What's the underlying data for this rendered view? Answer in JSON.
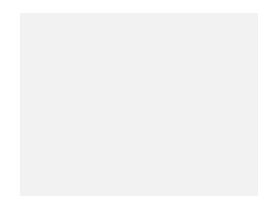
{
  "chart_data": {
    "type": "heatmap",
    "title": "",
    "columns": 29,
    "rows": 22,
    "colors": {
      "dark": "#4b4b4b",
      "light": "#ababab",
      "grid": "#f2f2f2"
    },
    "row_labels_left": [
      "22",
      "20",
      "18",
      "16",
      "14",
      "12",
      "10",
      "8",
      "6",
      "4",
      "2"
    ],
    "row_labels_right": [
      "21",
      "19",
      "17",
      "15",
      "13",
      "11",
      "9",
      "7",
      "5",
      "3",
      "1"
    ],
    "column_labels_bottom": [
      "28",
      "26",
      "24",
      "22",
      "20",
      "18",
      "16",
      "14",
      "12",
      "10",
      "8",
      "6",
      "4",
      "2"
    ],
    "legend": {
      "D": "dark",
      "L": "light"
    },
    "grid_top_to_bottom": [
      "LDDLLDDLLDDLLDDLLDDLLDDLLDDLL",
      "DDLDDLLDDLDDLLDDLDDLLDDLDDLDD",
      "DLDDLLDDLLDDLDDLDDLLDDLLDDLDD",
      "LDDLDDLDDLLDDLLLLDDLLDDLDDLDD",
      "DDDLDDDLDDDLDLDLDLDDDLDDDLDDD",
      "DLDDLDDDLDDLDDLDDLDDLDDDLDDLD",
      "LDDLDDLLDDDLDDDDDLDDDLLDDLDDL",
      "DDLDDLDDLLDDLDLDDLDLLDDLDDLDD",
      "LDDLDDLDDLDDDLDLDDDLDDLDDLDDL",
      "DLDDLDDLDDLDDDLDDDLDDLDDLDDLD",
      "DDLDDLDDLDDLDLLLDLDDLDDLDDLDD",
      "DDLDDLDDLDDLDLLLDLDDLDDLDDLDD",
      "DLDDLDDLDDLDDDLDDDLDDLDDLDDLD",
      "LDDLDDLDDLDDDLDLDDDLDDLDDLDDL",
      "DDLDDLDDLLDDLDLDDLDLLDDLDDLDD",
      "LDDLDDLLDDDLDDDDDLDDDLLDDLDDL",
      "DLDDLDDDLDDLDDLDDLDDLDDDLDDLD",
      "DDDLDDDLDDDLDLDLDLDDDLDDDLDDD",
      "LDDLDDLDDLLDDLLLLDDLLDDLDDLDD",
      "DLDDLLDDLLDDLDDLDDLLDDLLDDLDD",
      "DDLDDLLDDLDDLLDDLDDLLDDLDDLDD",
      "LDDLLDDLLDDLLDDLLDDLLDDLLDDLL"
    ]
  }
}
